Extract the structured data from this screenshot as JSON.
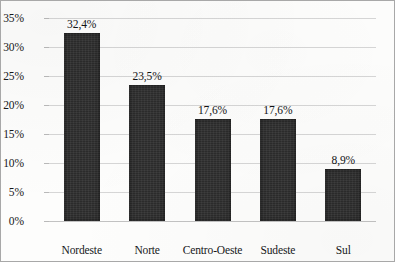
{
  "chart_data": {
    "type": "bar",
    "title": "",
    "subtitle": "",
    "xlabel": "",
    "ylabel": "",
    "categories": [
      "Nordeste",
      "Norte",
      "Centro-Oeste",
      "Sudeste",
      "Sul"
    ],
    "values": [
      32.4,
      23.5,
      17.6,
      17.6,
      8.9
    ],
    "value_labels": [
      "32,4%",
      "23,5%",
      "17,6%",
      "17,6%",
      "8,9%"
    ],
    "ylim": [
      0,
      35
    ],
    "ytick_values": [
      0,
      5,
      10,
      15,
      20,
      25,
      30,
      35
    ],
    "ytick_labels": [
      "0%",
      "5%",
      "10%",
      "15%",
      "20%",
      "25%",
      "30%",
      "35%"
    ],
    "grid": true,
    "legend": false,
    "legend_position": "none",
    "series": [
      {
        "name": "",
        "values": [
          32.4,
          23.5,
          17.6,
          17.6,
          8.9
        ],
        "color": "#2b2b2b"
      }
    ],
    "colors": {
      "bar": "#2b2b2b",
      "gridline": "#d6d6d6",
      "axis": "#c2c2c2",
      "text": "#16181a",
      "background": "#fdfdfc",
      "border": "#a8a8a8"
    }
  }
}
